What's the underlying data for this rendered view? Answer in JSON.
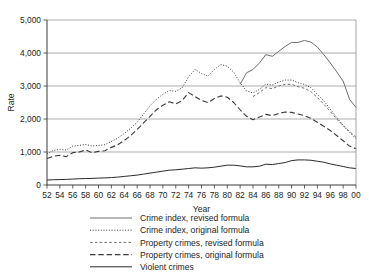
{
  "chart_data": {
    "type": "line",
    "title": "",
    "xlabel": "Year",
    "ylabel": "Rate",
    "xlim": [
      52,
      100
    ],
    "ylim": [
      0,
      5000
    ],
    "grid": true,
    "legend_position": "below",
    "ytick_labels": [
      "0",
      "1,000",
      "2,000",
      "3,000",
      "4,000",
      "5,000"
    ],
    "ytick_values": [
      0,
      1000,
      2000,
      3000,
      4000,
      5000
    ],
    "xtick_labels": [
      "52",
      "54",
      "56",
      "58",
      "60",
      "62",
      "64",
      "66",
      "68",
      "70",
      "72",
      "74",
      "76",
      "78",
      "80",
      "82",
      "84",
      "86",
      "88",
      "90",
      "92",
      "94",
      "96",
      "98",
      "00"
    ],
    "xtick_values": [
      52,
      54,
      56,
      58,
      60,
      62,
      64,
      66,
      68,
      70,
      72,
      74,
      76,
      78,
      80,
      82,
      84,
      86,
      88,
      90,
      92,
      94,
      96,
      98,
      100
    ],
    "x": [
      52,
      53,
      54,
      55,
      56,
      57,
      58,
      59,
      60,
      61,
      62,
      63,
      64,
      65,
      66,
      67,
      68,
      69,
      70,
      71,
      72,
      73,
      74,
      75,
      76,
      77,
      78,
      79,
      80,
      81,
      82,
      83,
      84,
      85,
      86,
      87,
      88,
      89,
      90,
      91,
      92,
      93,
      94,
      95,
      96,
      97,
      98,
      99,
      100
    ],
    "series": [
      {
        "name": "Crime index, revised formula",
        "style": "solid",
        "color": "#6e6e6e",
        "width": 1.0,
        "start_x": 82,
        "values": [
          null,
          null,
          null,
          null,
          null,
          null,
          null,
          null,
          null,
          null,
          null,
          null,
          null,
          null,
          null,
          null,
          null,
          null,
          null,
          null,
          null,
          null,
          null,
          null,
          null,
          null,
          null,
          null,
          null,
          null,
          3050,
          3400,
          3500,
          3700,
          3950,
          3900,
          4050,
          4200,
          4320,
          4320,
          4380,
          4330,
          4180,
          3950,
          3700,
          3430,
          3150,
          2600,
          2350
        ]
      },
      {
        "name": "Crime index, original formula",
        "style": "dotted",
        "color": "#3a3a3a",
        "width": 1.0,
        "start_x": 52,
        "values": [
          950,
          1050,
          1080,
          1060,
          1180,
          1200,
          1230,
          1180,
          1200,
          1220,
          1320,
          1420,
          1560,
          1720,
          1900,
          2150,
          2400,
          2600,
          2750,
          2860,
          2840,
          2950,
          3280,
          3500,
          3380,
          3300,
          3500,
          3650,
          3600,
          3420,
          3100,
          2850,
          2790,
          2900,
          3060,
          3030,
          3120,
          3180,
          3180,
          3100,
          3050,
          2950,
          2750,
          2550,
          2300,
          2050,
          1800,
          1600,
          1400
        ]
      },
      {
        "name": "Property crimes, revised formula",
        "style": "dashed-short",
        "color": "#6e6e6e",
        "width": 1.0,
        "start_x": 84,
        "values": [
          null,
          null,
          null,
          null,
          null,
          null,
          null,
          null,
          null,
          null,
          null,
          null,
          null,
          null,
          null,
          null,
          null,
          null,
          null,
          null,
          null,
          null,
          null,
          null,
          null,
          null,
          null,
          null,
          null,
          null,
          null,
          null,
          2680,
          2800,
          2950,
          2920,
          3000,
          3050,
          3050,
          2980,
          2930,
          2830,
          2650,
          2450,
          2230,
          2000,
          1800,
          1620,
          1450
        ]
      },
      {
        "name": "Property crimes, original formula",
        "style": "dashed-long",
        "color": "#3a3a3a",
        "width": 1.1,
        "start_x": 52,
        "values": [
          800,
          870,
          900,
          860,
          980,
          1000,
          1060,
          980,
          1020,
          1040,
          1140,
          1220,
          1350,
          1500,
          1680,
          1880,
          2080,
          2280,
          2420,
          2520,
          2460,
          2560,
          2800,
          2680,
          2560,
          2500,
          2620,
          2700,
          2660,
          2500,
          2280,
          2080,
          1980,
          2060,
          2140,
          2100,
          2170,
          2210,
          2200,
          2150,
          2100,
          2020,
          1900,
          1780,
          1650,
          1500,
          1340,
          1180,
          1100
        ]
      },
      {
        "name": "Violent crimes",
        "style": "solid",
        "color": "#2b2b2b",
        "width": 1.0,
        "start_x": 52,
        "values": [
          150,
          160,
          165,
          170,
          180,
          190,
          195,
          200,
          210,
          215,
          225,
          240,
          260,
          280,
          300,
          330,
          360,
          390,
          420,
          450,
          460,
          480,
          500,
          520,
          510,
          520,
          540,
          570,
          600,
          600,
          580,
          550,
          550,
          570,
          630,
          620,
          650,
          680,
          740,
          760,
          760,
          750,
          720,
          690,
          640,
          600,
          560,
          520,
          500
        ]
      }
    ]
  },
  "legend": {
    "items": [
      {
        "label": "Crime index, revised formula"
      },
      {
        "label": "Crime index, original formula"
      },
      {
        "label": "Property crimes, revised formula"
      },
      {
        "label": "Property crimes, original formula"
      },
      {
        "label": "Violent crimes"
      }
    ]
  }
}
